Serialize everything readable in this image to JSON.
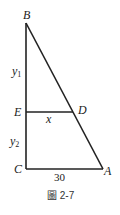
{
  "figure": {
    "caption": "圖 2-7",
    "points": {
      "B": "B",
      "E": "E",
      "C": "C",
      "A": "A",
      "D": "D"
    },
    "segment_labels": {
      "y1": "y",
      "y1_sub": "1",
      "y2": "y",
      "y2_sub": "2",
      "x": "x",
      "base": "30"
    },
    "colors": {
      "line": "#222222",
      "text": "#222222"
    }
  }
}
